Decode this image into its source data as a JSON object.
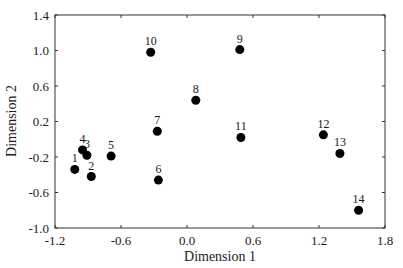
{
  "chart_data": {
    "type": "scatter",
    "title": "",
    "xlabel": "Dimension 1",
    "ylabel": "Dimension 2",
    "xlim": [
      -1.2,
      1.8
    ],
    "ylim": [
      -1.0,
      1.4
    ],
    "xticks": [
      -1.2,
      -0.6,
      0.0,
      0.6,
      1.2,
      1.8
    ],
    "yticks": [
      -1.0,
      -0.6,
      -0.2,
      0.2,
      0.6,
      1.0,
      1.4
    ],
    "xtick_labels": [
      "-1.2",
      "-0.6",
      "0.0",
      "0.6",
      "1.2",
      "1.8"
    ],
    "ytick_labels": [
      "-1.0",
      "-0.6",
      "-0.2",
      "0.2",
      "0.6",
      "1.0",
      "1.4"
    ],
    "grid": false,
    "legend": null,
    "points": [
      {
        "label": "1",
        "x": -1.02,
        "y": -0.34
      },
      {
        "label": "2",
        "x": -0.87,
        "y": -0.42
      },
      {
        "label": "3",
        "x": -0.91,
        "y": -0.18
      },
      {
        "label": "4",
        "x": -0.95,
        "y": -0.12
      },
      {
        "label": "5",
        "x": -0.69,
        "y": -0.19
      },
      {
        "label": "6",
        "x": -0.26,
        "y": -0.46
      },
      {
        "label": "7",
        "x": -0.27,
        "y": 0.09
      },
      {
        "label": "8",
        "x": 0.08,
        "y": 0.44
      },
      {
        "label": "9",
        "x": 0.48,
        "y": 1.01
      },
      {
        "label": "10",
        "x": -0.33,
        "y": 0.98
      },
      {
        "label": "11",
        "x": 0.49,
        "y": 0.02
      },
      {
        "label": "12",
        "x": 1.24,
        "y": 0.05
      },
      {
        "label": "13",
        "x": 1.39,
        "y": -0.16
      },
      {
        "label": "14",
        "x": 1.56,
        "y": -0.8
      }
    ],
    "marker_color": "#000000"
  }
}
